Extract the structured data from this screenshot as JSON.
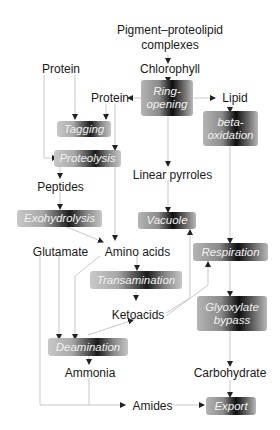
{
  "diagram": {
    "nodes": {
      "pigment": "Pigment–proteolipid",
      "complexes": "complexes",
      "chlorophyll": "Chlorophyll",
      "protein_left": "Protein",
      "protein_mid": "Protein",
      "lipid": "Lipid",
      "peptides": "Peptides",
      "linear_pyrroles": "Linear pyrroles",
      "glutamate": "Glutamate",
      "amino_acids": "Amino acids",
      "ketoacids": "Ketoacids",
      "ammonia": "Ammonia",
      "carbohydrate": "Carbohydrate",
      "amides": "Amides"
    },
    "processes": {
      "ring_opening_1": "Ring-",
      "ring_opening_2": "opening",
      "beta_1": "beta-",
      "beta_2": "oxidation",
      "tagging": "Tagging",
      "proteolysis": "Proteolysis",
      "exohydrolysis": "Exohydrolysis",
      "vacuole": "Vacuole",
      "respiration": "Respiration",
      "transamination": "Transamination",
      "glyoxylate_1": "Glyoxylate",
      "glyoxylate_2": "bypass",
      "deamination": "Deamination",
      "export": "Export"
    },
    "edges": [
      [
        "Pigment-proteolipid complexes",
        "Chlorophyll"
      ],
      [
        "Chlorophyll",
        "Ring-opening"
      ],
      [
        "Ring-opening",
        "Protein"
      ],
      [
        "Ring-opening",
        "Lipid"
      ],
      [
        "Ring-opening",
        "Linear pyrroles"
      ],
      [
        "Lipid",
        "beta-oxidation"
      ],
      [
        "beta-oxidation",
        "Respiration"
      ],
      [
        "Protein (left)",
        "Tagging"
      ],
      [
        "Protein (left)",
        "Proteolysis"
      ],
      [
        "Protein (mid)",
        "Tagging"
      ],
      [
        "Protein (mid)",
        "Proteolysis"
      ],
      [
        "Proteolysis",
        "Peptides"
      ],
      [
        "Peptides",
        "Exohydrolysis"
      ],
      [
        "Exohydrolysis",
        "Amino acids"
      ],
      [
        "Proteolysis",
        "Amino acids"
      ],
      [
        "Linear pyrroles",
        "Vacuole"
      ],
      [
        "Amino acids",
        "Transamination"
      ],
      [
        "Transamination",
        "Ketoacids"
      ],
      [
        "Amino acids",
        "Deamination"
      ],
      [
        "Glutamate",
        "Deamination"
      ],
      [
        "Deamination",
        "Ketoacids"
      ],
      [
        "Ketoacids",
        "Vacuole"
      ],
      [
        "Ketoacids",
        "Respiration"
      ],
      [
        "Respiration",
        "Glyoxylate bypass"
      ],
      [
        "Glyoxylate bypass",
        "Carbohydrate"
      ],
      [
        "Carbohydrate",
        "Export"
      ],
      [
        "Deamination",
        "Ammonia"
      ],
      [
        "Ammonia",
        "Amides"
      ],
      [
        "Glutamate",
        "Amides"
      ],
      [
        "Amides",
        "Export"
      ]
    ]
  }
}
